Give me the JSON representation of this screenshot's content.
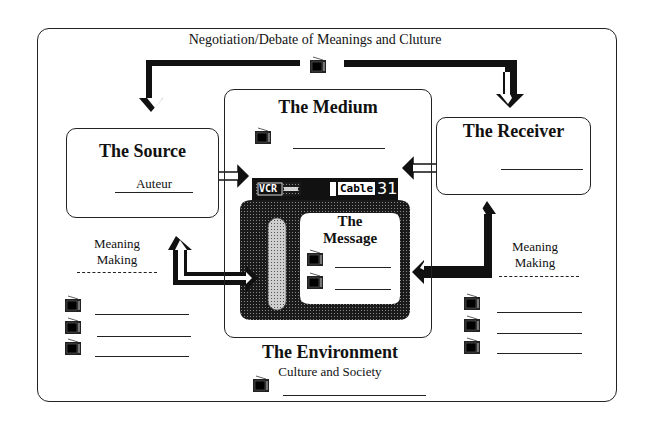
{
  "diagram": {
    "header": "Negotiation/Debate of Meanings and Cluture",
    "source": {
      "title": "The Source",
      "label": "Auteur"
    },
    "medium": {
      "title": "The Medium"
    },
    "receiver": {
      "title": "The Receiver"
    },
    "tv_panel": {
      "vcr_label": "VCR",
      "cable_label": "Cable",
      "channel": "31"
    },
    "message": {
      "title_line1": "The",
      "title_line2": "Message"
    },
    "left_meaning": {
      "line1": "Meaning",
      "line2": "Making"
    },
    "right_meaning": {
      "line1": "Meaning",
      "line2": "Making"
    },
    "environment": {
      "title": "The Environment",
      "subtitle": "Culture and Society"
    },
    "icons": {
      "tv": "television-icon",
      "arrow_double": "double-headed-arrow-icon",
      "arrow_elbow": "elbow-arrow-icon"
    },
    "colors": {
      "ink": "#111111",
      "background": "#ffffff",
      "screen_dark": "#1a1a1a",
      "screen_dots": "#777777"
    }
  }
}
